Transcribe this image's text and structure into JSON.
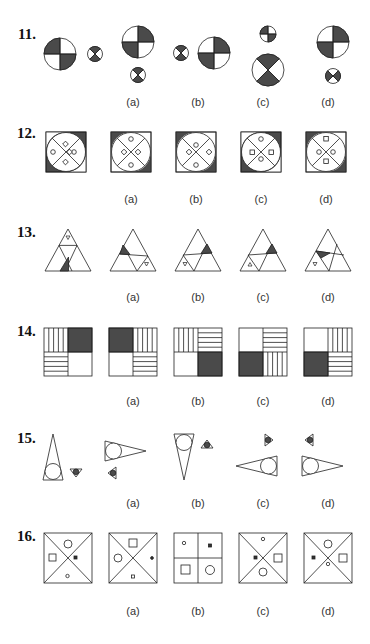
{
  "questions": [
    {
      "number": "11.",
      "options": [
        "(a)",
        "(b)",
        "(c)",
        "(d)"
      ]
    },
    {
      "number": "12.",
      "options": [
        "(a)",
        "(b)",
        "(c)",
        "(d)"
      ]
    },
    {
      "number": "13.",
      "options": [
        "(a)",
        "(b)",
        "(c)",
        "(d)"
      ]
    },
    {
      "number": "14.",
      "options": [
        "(a)",
        "(b)",
        "(c)",
        "(d)"
      ]
    },
    {
      "number": "15.",
      "options": [
        "(a)",
        "(b)",
        "(c)",
        "(d)"
      ]
    },
    {
      "number": "16.",
      "options": [
        "(a)",
        "(b)",
        "(c)",
        "(d)"
      ]
    }
  ],
  "colors": {
    "ink": "#222222",
    "fill": "#4a4a4a",
    "paper": "#ffffff"
  }
}
